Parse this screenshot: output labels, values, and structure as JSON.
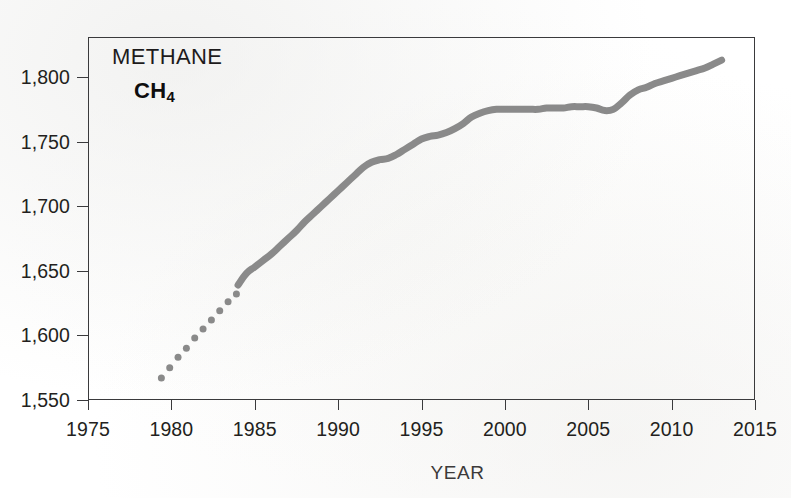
{
  "figure": {
    "background_color": "#ffffff",
    "frame_color": "#3a3a3c",
    "text_color": "#231f20"
  },
  "annotation": {
    "title": "METHANE",
    "formula_base": "CH",
    "formula_subscript": "4"
  },
  "axes": {
    "x_title": "YEAR",
    "y_tick_labels": [
      "1,800",
      "1,750",
      "1,700",
      "1,650",
      "1,600",
      "1,550"
    ],
    "x_tick_labels": [
      "1975",
      "1980",
      "1985",
      "1990",
      "1995",
      "2000",
      "2005",
      "2010",
      "2015"
    ]
  },
  "chart_data": {
    "type": "line",
    "title": "METHANE CH4",
    "subtitle": "",
    "xlabel": "YEAR",
    "ylabel": "",
    "xlim": [
      1975,
      2015
    ],
    "ylim": [
      1550,
      1812
    ],
    "grid": false,
    "legend": "none",
    "y_ticks": [
      1550,
      1600,
      1650,
      1700,
      1750,
      1800
    ],
    "x_ticks": [
      1975,
      1980,
      1985,
      1990,
      1995,
      2000,
      2005,
      2010,
      2015
    ],
    "series": [
      {
        "name": "Methane (CH4) dotted early record",
        "style": "dotted-markers",
        "color": "#8a8a8a",
        "marker_size": 7,
        "x": [
          1979.4,
          1979.9,
          1980.4,
          1980.9,
          1981.4,
          1981.9,
          1982.4,
          1982.9,
          1983.4,
          1983.9
        ],
        "y": [
          1567,
          1575,
          1583,
          1590,
          1598,
          1605,
          1612,
          1619,
          1626,
          1632
        ]
      },
      {
        "name": "Methane (CH4) continuous record",
        "style": "thick-line",
        "color": "#8a8a8a",
        "line_width": 7,
        "x": [
          1984.0,
          1984.5,
          1985.0,
          1985.5,
          1986.0,
          1986.5,
          1987.0,
          1987.5,
          1988.0,
          1988.5,
          1989.0,
          1989.5,
          1990.0,
          1990.5,
          1991.0,
          1991.5,
          1992.0,
          1992.5,
          1993.0,
          1993.5,
          1994.0,
          1994.5,
          1995.0,
          1995.5,
          1996.0,
          1996.5,
          1997.0,
          1997.5,
          1998.0,
          1998.5,
          1999.0,
          1999.5,
          2000.0,
          2000.5,
          2001.0,
          2001.5,
          2002.0,
          2002.5,
          2003.0,
          2003.5,
          2004.0,
          2004.5,
          2005.0,
          2005.5,
          2006.0,
          2006.5,
          2007.0,
          2007.5,
          2008.0,
          2008.5,
          2009.0,
          2009.5,
          2010.0,
          2010.5,
          2011.0,
          2011.5,
          2012.0,
          2012.5,
          2013.0
        ],
        "y": [
          1639,
          1648,
          1653,
          1658,
          1663,
          1669,
          1675,
          1681,
          1688,
          1694,
          1700,
          1706,
          1712,
          1718,
          1724,
          1730,
          1734,
          1736,
          1737,
          1740,
          1744,
          1748,
          1752,
          1754,
          1755,
          1757,
          1760,
          1764,
          1769,
          1772,
          1774,
          1775,
          1775,
          1775,
          1775,
          1775,
          1775,
          1776,
          1776,
          1776,
          1777,
          1777,
          1777,
          1776,
          1774,
          1775,
          1780,
          1786,
          1790,
          1792,
          1795,
          1797,
          1799,
          1801,
          1803,
          1805,
          1807,
          1810,
          1813
        ]
      }
    ],
    "annotations": [
      {
        "text": "METHANE",
        "x": 1979,
        "y": 1795
      },
      {
        "text": "CH4",
        "x": 1981,
        "y": 1776
      }
    ]
  }
}
